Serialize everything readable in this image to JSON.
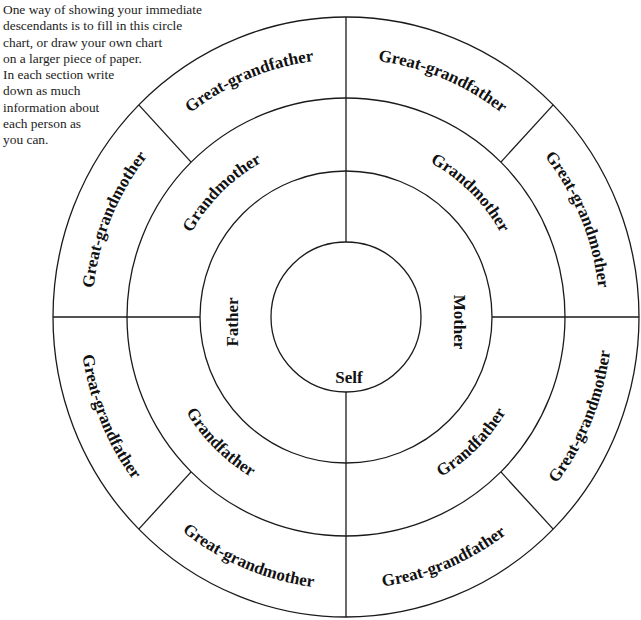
{
  "intro": {
    "lines": [
      "One way of showing your immediate",
      "descendants is to fill in this circle",
      "chart, or draw your own chart",
      "on a larger piece of paper.",
      "In each section write",
      "down as much",
      "information about",
      "each person as",
      "you can."
    ]
  },
  "chart": {
    "center": {
      "label": "Self"
    },
    "parents": {
      "left": "Father",
      "right": "Mother"
    },
    "grandparents": {
      "upper_left": "Grandmother",
      "upper_right": "Grandmother",
      "lower_left": "Grandfather",
      "lower_right": "Grandfather"
    },
    "great_grandparents": {
      "left_upper": "Great-grandmother",
      "top_left": "Great-grandfather",
      "top_right": "Great-grandfather",
      "right_upper": "Great-grandmother",
      "right_lower": "Great-grandmother",
      "bottom_right": "Great-grandfather",
      "bottom_left": "Great-grandmother",
      "left_lower": "Great-grandfather"
    },
    "line_color": "#1a1a1a",
    "text_color": "#111111"
  }
}
